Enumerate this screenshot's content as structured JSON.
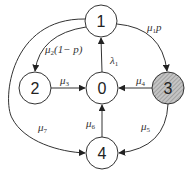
{
  "diagram": {
    "type": "state-transition",
    "colors": {
      "stroke": "#333333",
      "node_fill": "#ffffff",
      "highlight_fill": "#b8b8b8",
      "hatch": "#888888"
    },
    "nodes": [
      {
        "id": "1",
        "label": "1",
        "cx": 101,
        "cy": 21,
        "highlighted": false
      },
      {
        "id": "2",
        "label": "2",
        "cx": 35,
        "cy": 88,
        "highlighted": false
      },
      {
        "id": "0",
        "label": "0",
        "cx": 102,
        "cy": 88,
        "highlighted": false
      },
      {
        "id": "3",
        "label": "3",
        "cx": 168,
        "cy": 88,
        "highlighted": true
      },
      {
        "id": "4",
        "label": "4",
        "cx": 102,
        "cy": 153,
        "highlighted": false
      }
    ],
    "edges": [
      {
        "from": "0",
        "to": "1",
        "label": "λ",
        "sub": "1"
      },
      {
        "from": "1",
        "to": "3",
        "label": "μ",
        "sub": "1",
        "suffix": "p"
      },
      {
        "from": "1",
        "to": "2",
        "label": "μ",
        "sub": "2",
        "suffix": "(1− p)"
      },
      {
        "from": "2",
        "to": "0",
        "label": "μ",
        "sub": "3"
      },
      {
        "from": "3",
        "to": "0",
        "label": "μ",
        "sub": "4"
      },
      {
        "from": "3",
        "to": "4",
        "label": "μ",
        "sub": "5"
      },
      {
        "from": "4",
        "to": "0",
        "label": "μ",
        "sub": "6"
      },
      {
        "from": "1",
        "to": "4",
        "label": "μ",
        "sub": "7"
      }
    ]
  }
}
